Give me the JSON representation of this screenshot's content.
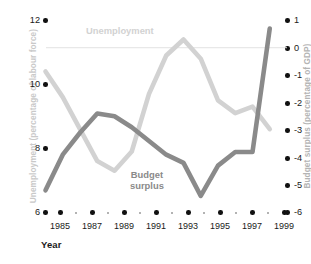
{
  "chart_data": {
    "type": "line",
    "title": "",
    "xlabel": "Year",
    "x": [
      1985,
      1986,
      1987,
      1988,
      1989,
      1990,
      1991,
      1992,
      1993,
      1994,
      1995,
      1996,
      1997,
      1998
    ],
    "xlim": [
      1985,
      1999
    ],
    "xticks": [
      1985,
      1987,
      1989,
      1991,
      1993,
      1995,
      1997,
      1999
    ],
    "xticklabels": [
      "1985",
      "1987",
      "1989",
      "1991",
      "1993",
      "1995",
      "1997",
      "1999"
    ],
    "grid": false,
    "legend": "inline-annotations",
    "zero_reference_line": 0,
    "series": [
      {
        "name": "Unemployment",
        "axis": "left",
        "color": "#d2d2d2",
        "ylabel": "Unemployment (percentage of labour force)",
        "ylim": [
          6,
          12
        ],
        "yticks": [
          6,
          8,
          10,
          12
        ],
        "yticklabels": [
          "6",
          "8",
          "10",
          "12"
        ],
        "values": [
          10.4,
          9.6,
          8.6,
          7.6,
          7.3,
          7.9,
          9.7,
          10.9,
          11.4,
          10.8,
          9.5,
          9.1,
          9.3,
          8.6
        ]
      },
      {
        "name": "Budget surplus",
        "axis": "right",
        "color": "#8a8a8a",
        "ylabel": "Budget surplus (percentage of GDP)",
        "ylim": [
          -6,
          1
        ],
        "yticks": [
          1,
          0,
          -1,
          -2,
          -3,
          -4,
          -5,
          -6
        ],
        "yticklabels": [
          "1",
          "0",
          "-1",
          "-2",
          "-3",
          "-4",
          "-5",
          "-6"
        ],
        "values": [
          -5.2,
          -3.9,
          -3.1,
          -2.4,
          -2.5,
          -2.9,
          -3.4,
          -3.9,
          -4.2,
          -5.4,
          -4.3,
          -3.8,
          -3.8,
          0.7
        ]
      }
    ]
  },
  "axes": {
    "left_title": "Unemployment (percentage of labour force)",
    "right_title": "Budget surplus (percentage of GDP)",
    "x_title": "Year",
    "left_ticks": [
      "12",
      "10",
      "8",
      "6"
    ],
    "right_ticks": [
      "1",
      "0",
      "-1",
      "-2",
      "-3",
      "-4",
      "-5",
      "-6"
    ],
    "x_ticks": [
      "1985",
      "1987",
      "1989",
      "1991",
      "1993",
      "1995",
      "1997",
      "1999"
    ]
  },
  "annotations": {
    "unemployment_label": "Unemployment",
    "budget_label": "Budget\nsurplus"
  },
  "colors": {
    "unemployment": "#d2d2d2",
    "budget": "#8a8a8a",
    "tick": "#111111",
    "zero_line": "#e2e2e2",
    "axis_title": "#c9c9c9"
  }
}
